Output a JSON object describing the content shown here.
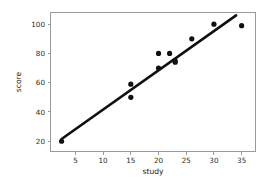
{
  "chart_data": {
    "type": "scatter",
    "title": "",
    "xlabel": "study",
    "ylabel": "score",
    "xlim": [
      0.5,
      37.5
    ],
    "ylim": [
      13,
      108
    ],
    "grid": false,
    "legend": null,
    "xticks": [
      5,
      10,
      15,
      20,
      25,
      30,
      35
    ],
    "yticks": [
      20,
      40,
      60,
      80,
      100
    ],
    "xticklabels": [
      "5",
      "10",
      "15",
      "20",
      "25",
      "30",
      "35"
    ],
    "yticklabels": [
      "20",
      "40",
      "60",
      "80",
      "100"
    ],
    "marker_color": "#101010",
    "line_color": "#101010",
    "points": [
      {
        "x": 2.5,
        "y": 20
      },
      {
        "x": 15,
        "y": 59
      },
      {
        "x": 15,
        "y": 50
      },
      {
        "x": 20,
        "y": 80
      },
      {
        "x": 20,
        "y": 70
      },
      {
        "x": 22,
        "y": 80
      },
      {
        "x": 23,
        "y": 75
      },
      {
        "x": 23,
        "y": 74
      },
      {
        "x": 26,
        "y": 90
      },
      {
        "x": 30,
        "y": 100
      },
      {
        "x": 35,
        "y": 99
      }
    ],
    "series": [
      {
        "name": "observations",
        "x": [
          2.5,
          15,
          15,
          20,
          20,
          22,
          23,
          23,
          26,
          30,
          35
        ],
        "values": [
          20,
          59,
          50,
          80,
          70,
          80,
          75,
          74,
          90,
          100,
          99
        ]
      }
    ],
    "regression_line": {
      "name": "fit",
      "x": [
        2.5,
        34.0
      ],
      "y": [
        21.5,
        106.0
      ]
    }
  },
  "figure": {
    "background": "#ffffff",
    "axes_background": "#ffffff",
    "spine_color": "#9a9a9a"
  }
}
